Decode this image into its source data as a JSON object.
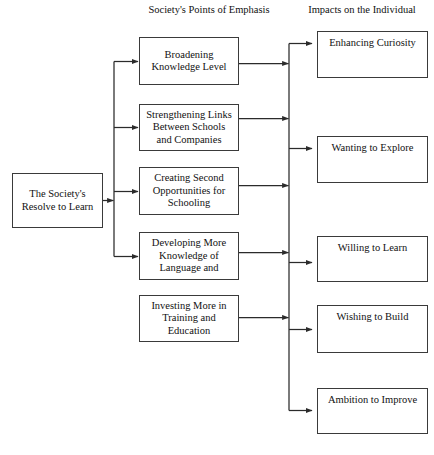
{
  "diagram": {
    "headers": {
      "society_column": "Society's Points of Emphasis",
      "impacts_column": "Impacts on the Individual"
    },
    "source_node": {
      "id": "society-resolve",
      "line1": "The Society's",
      "line2": "Resolve to Learn",
      "text": "The Society's Resolve to Learn"
    },
    "emphasis_nodes": [
      {
        "id": "broadening-knowledge-level",
        "line1": "Broadening",
        "line2": "Knowledge Level",
        "line3": "",
        "text": "Broadening Knowledge Level"
      },
      {
        "id": "strengthening-links",
        "line1": "Strengthening Links",
        "line2": "Between Schools",
        "line3": "and Companies",
        "text": "Strengthening Links Between Schools and Companies"
      },
      {
        "id": "creating-second-opportunities",
        "line1": "Creating Second",
        "line2": "Opportunities for",
        "line3": "Schooling",
        "text": "Creating Second Opportunities for Schooling"
      },
      {
        "id": "developing-more-knowledge-of-language",
        "line1": "Developing More",
        "line2": "Knowledge of",
        "line3": "Language and",
        "text": "Developing More Knowledge of Language and"
      },
      {
        "id": "investing-more-in-training",
        "line1": "Investing More in",
        "line2": "Training and",
        "line3": "Education",
        "text": "Investing More in Training and Education"
      }
    ],
    "impact_nodes": [
      {
        "id": "enhancing-curiosity",
        "text": "Enhancing Curiosity"
      },
      {
        "id": "wanting-to-explore",
        "text": "Wanting to Explore"
      },
      {
        "id": "willing-to-learn",
        "text": "Willing to Learn"
      },
      {
        "id": "wishing-to-build",
        "text": "Wishing to Build"
      },
      {
        "id": "ambition-to-improve",
        "text": "Ambition to Improve"
      }
    ],
    "colors": {
      "background": "#ffffff",
      "box_border": "#3a3a3a",
      "connector": "#2b2b2b",
      "text": "#111111"
    }
  }
}
